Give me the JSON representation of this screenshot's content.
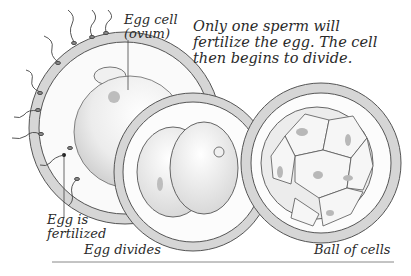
{
  "diagram": {
    "caption": "Only one sperm will\nfertilize the egg. The cell\nthen begins to divide.",
    "labels": {
      "egg_cell": "Egg cell\n(ovum)",
      "egg_fertilized": "Egg is\nfertilized",
      "egg_divides": "Egg divides",
      "ball_of_cells": "Ball of cells"
    },
    "stages": [
      {
        "name": "fertilization",
        "label": "Egg is fertilized"
      },
      {
        "name": "two-cell",
        "label": "Egg divides"
      },
      {
        "name": "morula",
        "label": "Ball of cells"
      }
    ],
    "colors": {
      "outline": "#444444",
      "shell": "#d4d4d4",
      "cell_fill": "#f2f2f2",
      "nucleus": "#b8b8b8",
      "rule": "#888888"
    }
  }
}
